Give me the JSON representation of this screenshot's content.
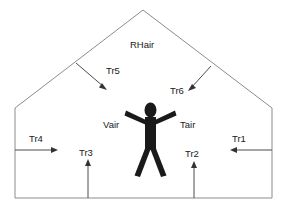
{
  "diagram": {
    "canvas": {
      "width": 286,
      "height": 213
    },
    "colors": {
      "outline": "#8c8c8c",
      "arrow": "#4d4d4d",
      "figure": "#1a1a1a",
      "text": "#1a1a1a",
      "background": "#ffffff"
    },
    "labels": {
      "attic": "RHair",
      "room_volume": "Vair",
      "room_temperature": "Tair"
    },
    "flows": [
      {
        "id": "Tr1",
        "label": "Tr1",
        "direction": "left",
        "description": "heat flow inward through right wall"
      },
      {
        "id": "Tr2",
        "label": "Tr2",
        "direction": "up",
        "description": "heat flow upward through floor right"
      },
      {
        "id": "Tr3",
        "label": "Tr3",
        "direction": "up",
        "description": "heat flow upward through floor left"
      },
      {
        "id": "Tr4",
        "label": "Tr4",
        "direction": "right",
        "description": "heat flow inward through left wall"
      },
      {
        "id": "Tr5",
        "label": "Tr5",
        "direction": "down-right",
        "description": "heat flow from attic through left ceiling"
      },
      {
        "id": "Tr6",
        "label": "Tr6",
        "direction": "down-left",
        "description": "heat flow from attic through right ceiling"
      }
    ],
    "occupant": {
      "name": "person",
      "pose": "arms-raised"
    }
  }
}
